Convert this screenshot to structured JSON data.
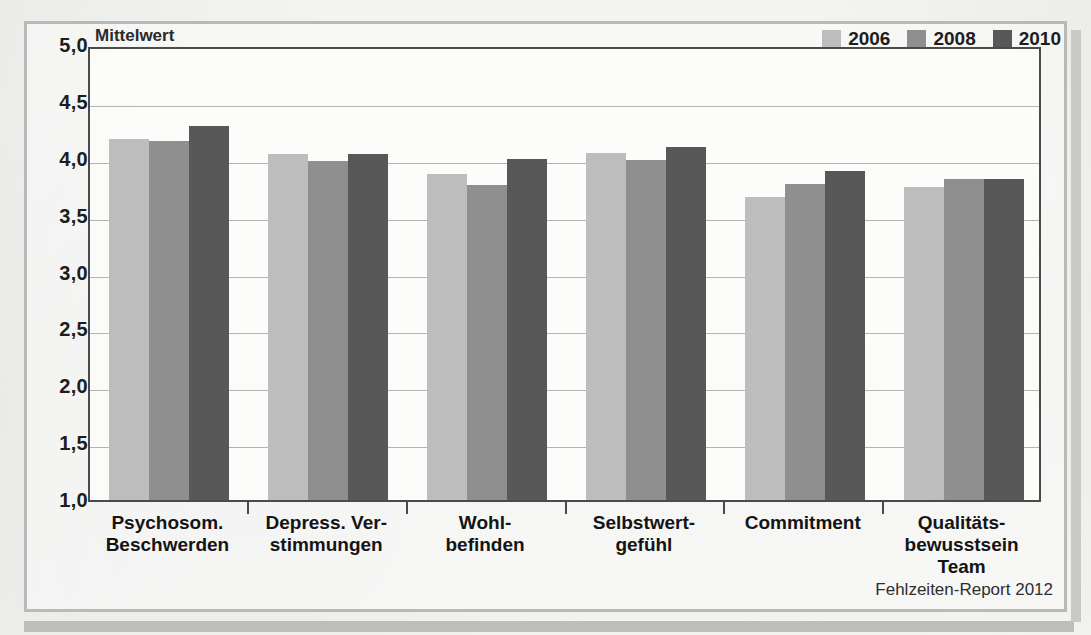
{
  "figure": {
    "axis_unit_label": "Mittelwert",
    "source_note": "Fehlzeiten-Report 2012"
  },
  "colors": {
    "series_2006": "#bdbdbd",
    "series_2008": "#8f8f8f",
    "series_2010": "#585858",
    "axis": "#4a4a4a",
    "gridline": "#b4b4b2",
    "text": "#1d1d1d",
    "frame": "#b9b9b7",
    "page_background": "#f3f3f1"
  },
  "chart_data": {
    "type": "bar",
    "title": "",
    "subtitle": "",
    "xlabel": "",
    "ylabel": "Mittelwert",
    "ylim": [
      1.0,
      5.0
    ],
    "ytick_labels": [
      "5,0",
      "4,5",
      "4,0",
      "3,5",
      "3,0",
      "2,5",
      "2,0",
      "1,5",
      "1,0"
    ],
    "ytick_values": [
      5.0,
      4.5,
      4.0,
      3.5,
      3.0,
      2.5,
      2.0,
      1.5,
      1.0
    ],
    "grid": true,
    "legend_position": "top-right",
    "categories": [
      "Psychosom.\nBeschwerden",
      "Depress. Ver-\nstimmungen",
      "Wohl-\nbefinden",
      "Selbstwert-\ngefühl",
      "Commitment",
      "Qualitäts-\nbewusstsein\nTeam"
    ],
    "series": [
      {
        "name": "2006",
        "color": "#bdbdbd",
        "values": [
          4.17,
          4.04,
          3.87,
          4.05,
          3.66,
          3.75
        ]
      },
      {
        "name": "2008",
        "color": "#8f8f8f",
        "values": [
          4.16,
          3.98,
          3.77,
          3.99,
          3.78,
          3.82
        ]
      },
      {
        "name": "2010",
        "color": "#585858",
        "values": [
          4.29,
          4.04,
          4.0,
          4.1,
          3.89,
          3.82
        ]
      }
    ]
  }
}
